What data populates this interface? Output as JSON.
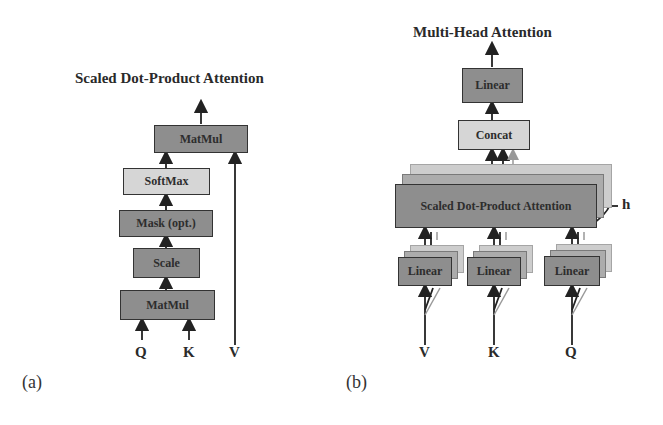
{
  "left_panel": {
    "title": "Scaled Dot-Product Attention",
    "caption": "(a)",
    "blocks": {
      "matmul_top": "MatMul",
      "softmax": "SoftMax",
      "mask": "Mask (opt.)",
      "scale": "Scale",
      "matmul_bottom": "MatMul"
    },
    "inputs": {
      "q": "Q",
      "k": "K",
      "v": "V"
    }
  },
  "right_panel": {
    "title": "Multi-Head Attention",
    "caption": "(b)",
    "blocks": {
      "linear_top": "Linear",
      "concat": "Concat",
      "sdpa": "Scaled Dot-Product Attention",
      "linear_v": "Linear",
      "linear_k": "Linear",
      "linear_q": "Linear"
    },
    "heads_label": "h",
    "inputs": {
      "v": "V",
      "k": "K",
      "q": "Q"
    }
  },
  "colors": {
    "dark_block": "#8e8e8e",
    "light_block": "#d6d6d6",
    "stroke": "#333333"
  }
}
